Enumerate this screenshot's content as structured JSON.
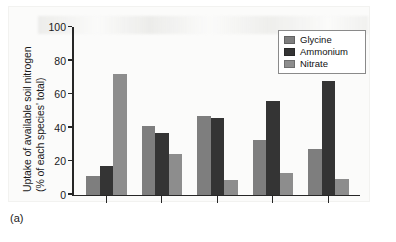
{
  "figure": {
    "panel_label": "(a)"
  },
  "chart_data": {
    "type": "bar",
    "title": "",
    "subtitle": "",
    "xlabel": "",
    "ylabel": "Uptake of available soil nitrogen (% of each species' total)",
    "ylabel_lines": [
      "Uptake of available soil nitrogen",
      "(% of each species' total)"
    ],
    "ylim": [
      0,
      100
    ],
    "yticks": [
      0,
      20,
      40,
      60,
      80,
      100
    ],
    "ytick_labels": [
      "0",
      "20",
      "40",
      "60",
      "80",
      "100"
    ],
    "grid": false,
    "legend_position": "top-right",
    "categories": [
      "1",
      "2",
      "3",
      "4",
      "5"
    ],
    "xtick_labels": [
      "",
      "",
      "",
      "",
      ""
    ],
    "series": [
      {
        "name": "Glycine",
        "color": "#7e7e7e",
        "values": [
          11,
          41,
          47,
          32.5,
          27
        ]
      },
      {
        "name": "Ammonium",
        "color": "#343434",
        "values": [
          17,
          36.5,
          45.5,
          56,
          68
        ]
      },
      {
        "name": "Nitrate",
        "color": "#8d8d8d",
        "values": [
          72,
          24,
          8.5,
          13,
          9
        ]
      }
    ]
  }
}
